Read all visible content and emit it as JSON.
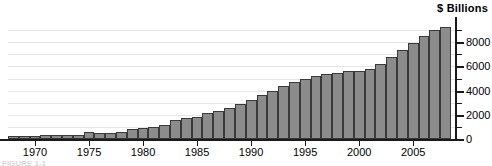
{
  "chart_data": {
    "type": "bar",
    "title": "$ Billions",
    "xlabel": "",
    "ylabel": "$ Billions",
    "ylim": [
      0,
      10000
    ],
    "xlim": [
      1967.5,
      2008.5
    ],
    "grid": true,
    "legend": "none",
    "y_ticks_major": [
      0,
      2000,
      4000,
      6000,
      8000
    ],
    "y_ticks_minor": [
      1000,
      3000,
      5000,
      7000,
      9000
    ],
    "y_tick_labels": [
      "0",
      "2000",
      "4000",
      "6000",
      "8000"
    ],
    "x_tick_labels": [
      "1970",
      "1975",
      "1980",
      "1985",
      "1990",
      "1995",
      "2000",
      "2005"
    ],
    "x_ticks": [
      1970,
      1975,
      1980,
      1985,
      1990,
      1995,
      2000,
      2005
    ],
    "categories": [
      1968,
      1969,
      1970,
      1971,
      1972,
      1973,
      1974,
      1975,
      1976,
      1977,
      1978,
      1979,
      1980,
      1981,
      1982,
      1983,
      1984,
      1985,
      1986,
      1987,
      1988,
      1989,
      1990,
      1991,
      1992,
      1993,
      1994,
      1995,
      1996,
      1997,
      1998,
      1999,
      2000,
      2001,
      2002,
      2003,
      2004,
      2005,
      2006,
      2007,
      2008
    ],
    "values": [
      140,
      150,
      290,
      310,
      300,
      310,
      320,
      540,
      510,
      480,
      550,
      830,
      910,
      990,
      1140,
      1570,
      1700,
      1820,
      2130,
      2350,
      2600,
      2870,
      3210,
      3660,
      3980,
      4350,
      4690,
      4950,
      5180,
      5370,
      5470,
      5600,
      5630,
      5770,
      6200,
      6760,
      7350,
      7930,
      8500,
      9000,
      9260
    ],
    "bar_color": "#8c8c8c",
    "bar_edge_color": "#3a3a3a",
    "gridline_color": "#e6e6e6",
    "axis_color": "#1a1a1a",
    "caption": "FIGURE 1-1"
  }
}
